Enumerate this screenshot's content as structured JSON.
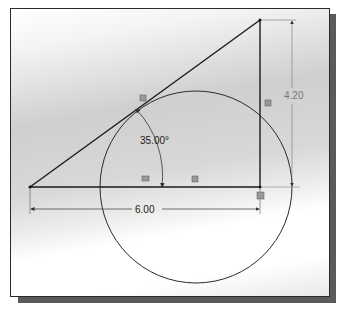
{
  "diagram": {
    "type": "cad-sketch",
    "dimensions": {
      "angle": "35.00°",
      "horizontal": "6.00",
      "vertical": "4.20"
    },
    "entities": [
      {
        "name": "hypotenuse-line"
      },
      {
        "name": "base-line"
      },
      {
        "name": "vertical-line"
      },
      {
        "name": "circle"
      }
    ],
    "colors": {
      "line": "#1a1a1a",
      "dimension": "#555555",
      "frame_border": "#2a2a2a",
      "shadow": "#5a5a5a"
    }
  }
}
